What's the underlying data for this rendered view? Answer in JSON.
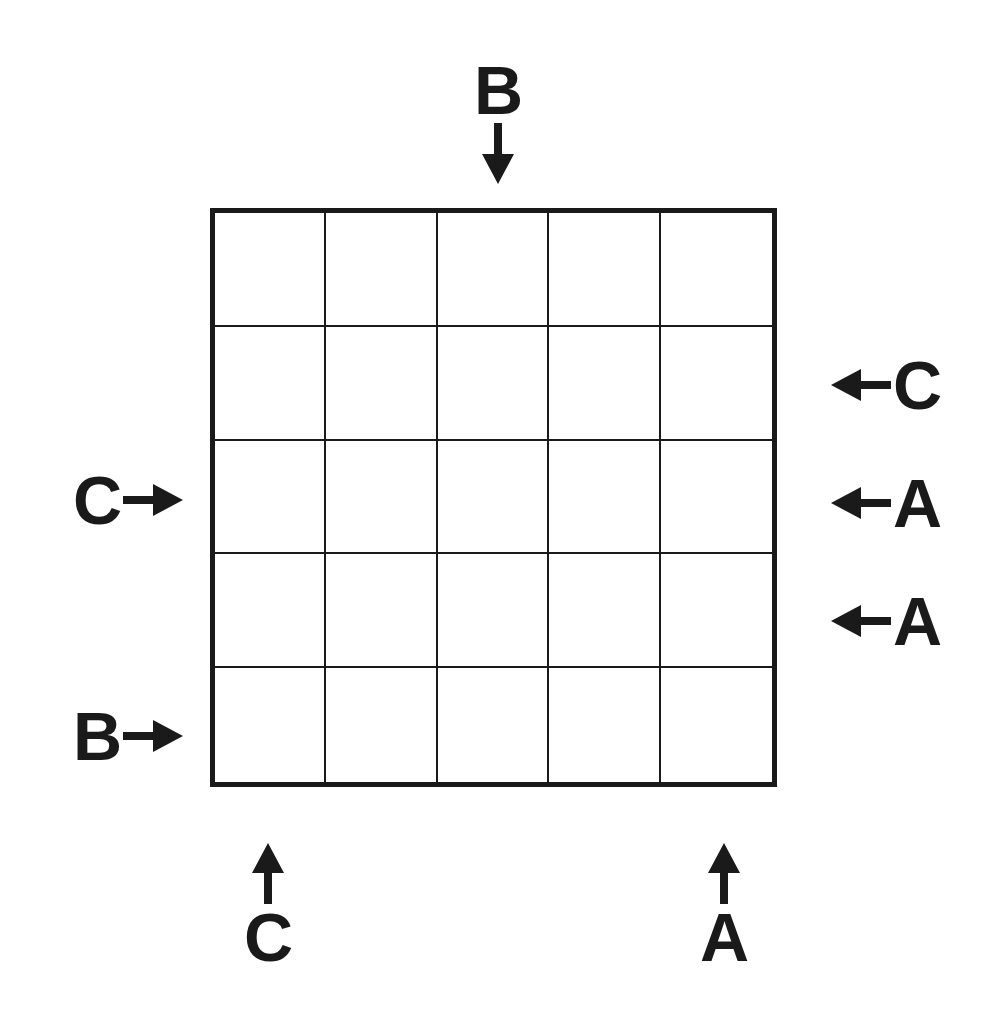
{
  "puzzle": {
    "type": "skyscrapers-style-grid-puzzle",
    "grid": {
      "rows": 5,
      "columns": 5,
      "cells": [
        [
          "",
          "",
          "",
          "",
          ""
        ],
        [
          "",
          "",
          "",
          "",
          ""
        ],
        [
          "",
          "",
          "",
          "",
          ""
        ],
        [
          "",
          "",
          "",
          "",
          ""
        ],
        [
          "",
          "",
          "",
          "",
          ""
        ]
      ],
      "border_color": "#1a1a1a",
      "cell_background": "#ffffff"
    },
    "clues": {
      "top": [
        {
          "label": "B",
          "column": 3,
          "arrow": "arrow-down-icon",
          "direction": "down"
        }
      ],
      "right": [
        {
          "label": "C",
          "row": 2,
          "arrow": "arrow-left-icon",
          "direction": "left"
        },
        {
          "label": "A",
          "row": 3,
          "arrow": "arrow-left-icon",
          "direction": "left"
        },
        {
          "label": "A",
          "row": 4,
          "arrow": "arrow-left-icon",
          "direction": "left"
        }
      ],
      "left": [
        {
          "label": "C",
          "row": 3,
          "arrow": "arrow-right-icon",
          "direction": "right"
        },
        {
          "label": "B",
          "row": 5,
          "arrow": "arrow-right-icon",
          "direction": "right"
        }
      ],
      "bottom": [
        {
          "label": "C",
          "column": 1,
          "arrow": "arrow-up-icon",
          "direction": "up"
        },
        {
          "label": "A",
          "column": 5,
          "arrow": "arrow-up-icon",
          "direction": "up"
        }
      ]
    },
    "colors": {
      "ink": "#1a1a1a",
      "paper": "#ffffff"
    }
  }
}
